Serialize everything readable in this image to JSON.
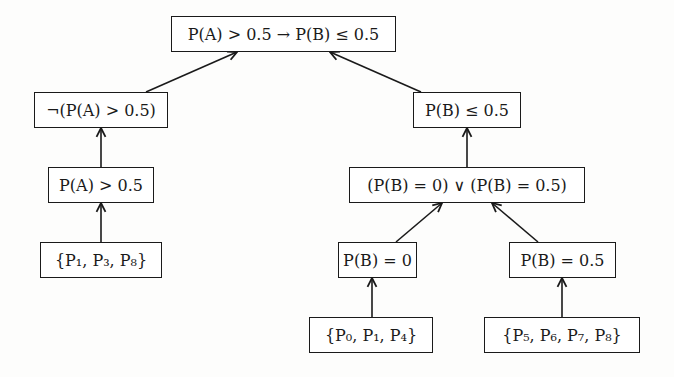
{
  "diagram": {
    "type": "derivation-tree",
    "nodes": {
      "root": {
        "label": "P(A) > 0.5 → P(B) ≤ 0.5"
      },
      "neg_pa": {
        "label": "¬(P(A) > 0.5)"
      },
      "pb_le": {
        "label": "P(B) ≤ 0.5"
      },
      "pa_gt": {
        "label": "P(A) > 0.5"
      },
      "disj": {
        "label": "(P(B) = 0) ∨ (P(B) = 0.5)"
      },
      "leaf_a": {
        "label": "{P₁, P₃, P₈}"
      },
      "pb_0": {
        "label": "P(B) = 0"
      },
      "pb_05": {
        "label": "P(B) = 0.5"
      },
      "leaf_0": {
        "label": "{P₀, P₁, P₄}"
      },
      "leaf_5": {
        "label": "{P₅, P₆, P₇, P₈}"
      }
    },
    "edges": [
      {
        "from": "neg_pa",
        "to": "root"
      },
      {
        "from": "pb_le",
        "to": "root"
      },
      {
        "from": "pa_gt",
        "to": "neg_pa"
      },
      {
        "from": "leaf_a",
        "to": "pa_gt"
      },
      {
        "from": "disj",
        "to": "pb_le"
      },
      {
        "from": "pb_0",
        "to": "disj"
      },
      {
        "from": "pb_05",
        "to": "disj"
      },
      {
        "from": "leaf_0",
        "to": "pb_0"
      },
      {
        "from": "leaf_5",
        "to": "pb_05"
      }
    ]
  }
}
